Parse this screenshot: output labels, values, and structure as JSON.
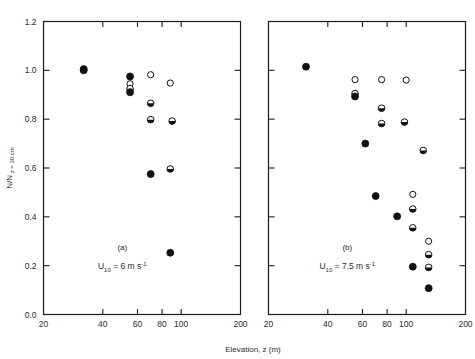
{
  "figure": {
    "xlabel": "Elevation, z (m)",
    "ylabel": "N/N",
    "ylabel_sub": "z = 30 cm"
  },
  "chart_data": {
    "type": "scatter",
    "title": "",
    "xlabel": "Elevation, z (m)",
    "ylabel": "N/N z = 30 cm",
    "xscale": "log",
    "yscale": "linear",
    "xlim": [
      20,
      200
    ],
    "ylim": [
      0.0,
      1.2
    ],
    "xticks": [
      20,
      40,
      60,
      80,
      100,
      200
    ],
    "xtick_labels": [
      "20",
      "40",
      "60",
      "80",
      "100",
      "200"
    ],
    "yticks": [
      0.0,
      0.2,
      0.4,
      0.6,
      0.8,
      1.0,
      1.2
    ],
    "ytick_labels": [
      "0.0",
      "0.2",
      "0.4",
      "0.6",
      "0.8",
      "1.0",
      "1.2"
    ],
    "grid": false,
    "legend": "none",
    "marker_styles": [
      "filled",
      "open",
      "half"
    ],
    "panels": [
      {
        "id": "a",
        "panel_label": "(a)",
        "annotation": "U10 = 6 m s-1",
        "annotation_base": "U",
        "annotation_sub": "10",
        "annotation_mid": " = 6 m s",
        "annotation_sup": "-1",
        "points": [
          {
            "x": 32.0,
            "y": 1.005,
            "marker": "filled"
          },
          {
            "x": 32.0,
            "y": 1.0,
            "marker": "filled"
          },
          {
            "x": 55.0,
            "y": 0.975,
            "marker": "filled"
          },
          {
            "x": 55.0,
            "y": 0.945,
            "marker": "open"
          },
          {
            "x": 55.0,
            "y": 0.925,
            "marker": "half"
          },
          {
            "x": 55.0,
            "y": 0.91,
            "marker": "filled"
          },
          {
            "x": 70.0,
            "y": 0.982,
            "marker": "open"
          },
          {
            "x": 88.0,
            "y": 0.948,
            "marker": "open"
          },
          {
            "x": 70.0,
            "y": 0.865,
            "marker": "half"
          },
          {
            "x": 70.0,
            "y": 0.798,
            "marker": "half"
          },
          {
            "x": 90.0,
            "y": 0.792,
            "marker": "half"
          },
          {
            "x": 70.0,
            "y": 0.575,
            "marker": "filled"
          },
          {
            "x": 88.0,
            "y": 0.596,
            "marker": "half"
          },
          {
            "x": 88.0,
            "y": 0.253,
            "marker": "filled"
          }
        ]
      },
      {
        "id": "b",
        "panel_label": "(b)",
        "annotation": "U10 = 7.5 m s-1",
        "annotation_base": "U",
        "annotation_sub": "10",
        "annotation_mid": " = 7.5 m s",
        "annotation_sup": "-1",
        "points": [
          {
            "x": 31.0,
            "y": 1.015,
            "marker": "filled"
          },
          {
            "x": 55.0,
            "y": 0.962,
            "marker": "open"
          },
          {
            "x": 75.0,
            "y": 0.962,
            "marker": "open"
          },
          {
            "x": 100.0,
            "y": 0.96,
            "marker": "open"
          },
          {
            "x": 55.0,
            "y": 0.905,
            "marker": "half"
          },
          {
            "x": 55.0,
            "y": 0.893,
            "marker": "filled"
          },
          {
            "x": 75.0,
            "y": 0.845,
            "marker": "half"
          },
          {
            "x": 75.0,
            "y": 0.782,
            "marker": "half"
          },
          {
            "x": 98.0,
            "y": 0.788,
            "marker": "half"
          },
          {
            "x": 62.0,
            "y": 0.7,
            "marker": "filled"
          },
          {
            "x": 122.0,
            "y": 0.672,
            "marker": "half"
          },
          {
            "x": 70.0,
            "y": 0.485,
            "marker": "filled"
          },
          {
            "x": 108.0,
            "y": 0.492,
            "marker": "open"
          },
          {
            "x": 108.0,
            "y": 0.432,
            "marker": "half"
          },
          {
            "x": 90.0,
            "y": 0.402,
            "marker": "filled"
          },
          {
            "x": 108.0,
            "y": 0.355,
            "marker": "half"
          },
          {
            "x": 130.0,
            "y": 0.3,
            "marker": "open"
          },
          {
            "x": 130.0,
            "y": 0.245,
            "marker": "half"
          },
          {
            "x": 108.0,
            "y": 0.196,
            "marker": "filled"
          },
          {
            "x": 130.0,
            "y": 0.193,
            "marker": "half"
          },
          {
            "x": 130.0,
            "y": 0.108,
            "marker": "filled"
          }
        ]
      }
    ]
  }
}
